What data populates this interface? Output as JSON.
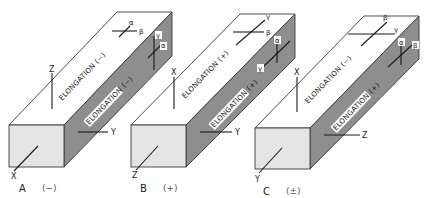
{
  "figure": {
    "colors": {
      "top_face": "#ffffff",
      "side_face": "#8e8e8e",
      "front_face": "#e4e4e4",
      "line": "#1a1a1a"
    },
    "crystals": [
      {
        "id": "A",
        "label": "A",
        "sign": "(−)",
        "top_elongation": "ELONGATION (−)",
        "side_elongation": "ELONGATION (−)",
        "axes": {
          "front": "X",
          "side": "Y",
          "vertical": "Z"
        },
        "top_indicatrix": {
          "a": "α",
          "b": "β"
        },
        "side_indicatrix": {
          "a": "γ",
          "b": "α"
        }
      },
      {
        "id": "B",
        "label": "B",
        "sign": "(+)",
        "top_elongation": "ELONGATION (+)",
        "side_elongation": "ELONGATION (+)",
        "axes": {
          "front": "Z",
          "side": "Y",
          "vertical": "X"
        },
        "top_indicatrix": {
          "a": "γ",
          "b": "β"
        },
        "side_indicatrix": {
          "a": "α",
          "b": "γ"
        }
      },
      {
        "id": "C",
        "label": "C",
        "sign": "(±)",
        "top_elongation": "ELONGATION (−)",
        "side_elongation": "ELONGATION (+)",
        "axes": {
          "front": "Y",
          "side": "Z",
          "vertical": "X"
        },
        "top_indicatrix": {
          "a": "β",
          "b": "γ"
        },
        "side_indicatrix": {
          "a": "α",
          "b": "β"
        }
      }
    ]
  }
}
